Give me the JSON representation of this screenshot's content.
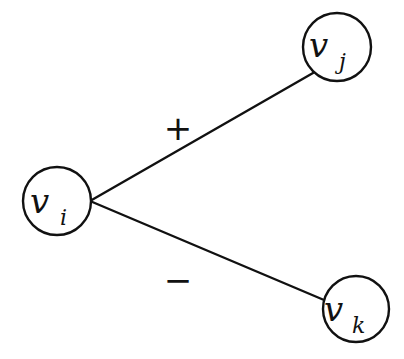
{
  "diagram": {
    "type": "signed-graph",
    "nodes": [
      {
        "id": "vi",
        "main": "v",
        "sub": "i",
        "cx": 57,
        "cy": 201,
        "r": 34
      },
      {
        "id": "vj",
        "main": "v",
        "sub": "j",
        "cx": 337,
        "cy": 47,
        "r": 34
      },
      {
        "id": "vk",
        "main": "v",
        "sub": "k",
        "cx": 356,
        "cy": 309,
        "r": 33
      }
    ],
    "edges": [
      {
        "from": "vi",
        "to": "vj",
        "sign": "+"
      },
      {
        "from": "vi",
        "to": "vk",
        "sign": "−"
      }
    ],
    "labels": {
      "positive": "+",
      "negative": "−"
    }
  }
}
